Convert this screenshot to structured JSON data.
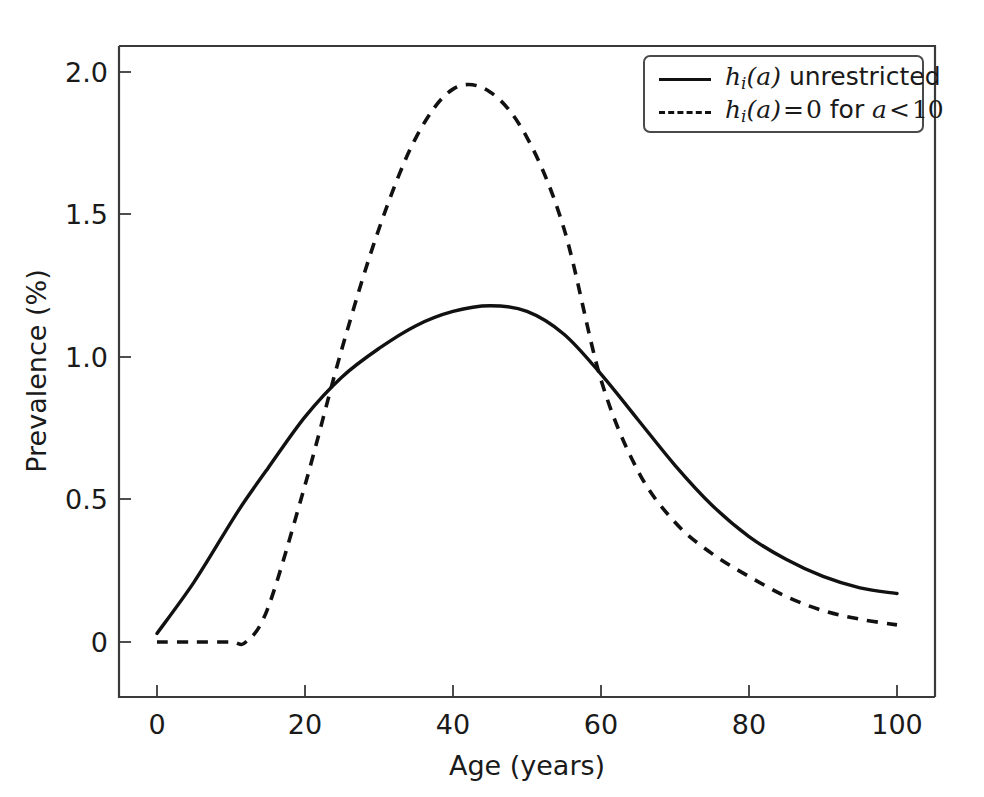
{
  "chart_data": {
    "type": "line",
    "title": "",
    "xlabel": "Age (years)",
    "ylabel": "Prevalence (%)",
    "xlim": [
      -3,
      103
    ],
    "ylim": [
      -0.12,
      2.18
    ],
    "xticks": [
      "0",
      "20",
      "40",
      "60",
      "80",
      "100"
    ],
    "xtick_values": [
      0,
      20,
      40,
      60,
      80,
      100
    ],
    "yticks": [
      "0",
      "0.5",
      "1.0",
      "1.5",
      "2.0"
    ],
    "ytick_values": [
      0,
      0.5,
      1.0,
      1.5,
      2.0
    ],
    "grid": false,
    "legend_position": "upper right",
    "x": [
      0,
      5,
      10,
      12,
      15,
      20,
      25,
      30,
      35,
      40,
      45,
      50,
      55,
      60,
      65,
      70,
      75,
      80,
      85,
      90,
      95,
      100
    ],
    "series": [
      {
        "name": "h_i(a) unrestricted",
        "style": "solid",
        "color": "#111111",
        "values": [
          0.03,
          0.21,
          0.42,
          0.5,
          0.61,
          0.79,
          0.93,
          1.03,
          1.11,
          1.16,
          1.18,
          1.16,
          1.08,
          0.94,
          0.78,
          0.62,
          0.48,
          0.37,
          0.29,
          0.23,
          0.19,
          0.17
        ]
      },
      {
        "name": "h_i(a) = 0 for a < 10",
        "style": "dashed",
        "color": "#111111",
        "values": [
          0.0,
          0.0,
          0.0,
          0.0,
          0.12,
          0.55,
          1.03,
          1.45,
          1.77,
          1.94,
          1.93,
          1.77,
          1.45,
          0.92,
          0.6,
          0.42,
          0.31,
          0.23,
          0.16,
          0.11,
          0.08,
          0.06
        ]
      }
    ],
    "annotations": {
      "solid_peak": {
        "age": 45,
        "value": 1.18
      },
      "dashed_peak": {
        "age": 40,
        "value": 1.94
      },
      "crossing_low": {
        "age": 22,
        "value": 0.86
      },
      "crossing_high": {
        "age": 61,
        "value": 0.91
      },
      "dashed_zero_until_age": 12
    }
  },
  "legend": {
    "entries": [
      {
        "swatch": "solid-line-swatch",
        "prefix_fn": "h",
        "prefix_sub": "i",
        "prefix_arg": "(a)",
        "text": "unrestricted",
        "full": "h_i(a) unrestricted"
      },
      {
        "swatch": "dashed-line-swatch",
        "prefix_fn": "h",
        "prefix_sub": "i",
        "prefix_arg": "(a)",
        "eq": "=",
        "zero": "0",
        "word": "for",
        "var": "a",
        "lt": "<",
        "threshold": "10",
        "full": "h_i(a) = 0 for a < 10"
      }
    ]
  }
}
